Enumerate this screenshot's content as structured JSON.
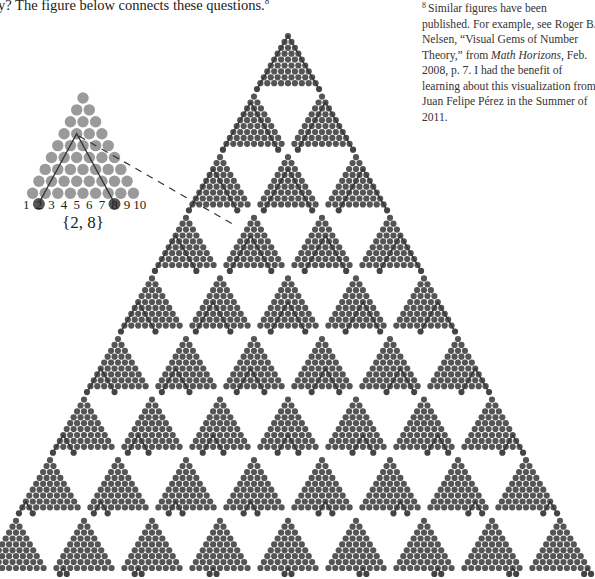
{
  "intro_text": "y? The figure below connects these questions.",
  "intro_footnote_ref": "8",
  "footnote": {
    "mark": "8",
    "text_before_italic": "Similar figures have been published. For example, see Roger B. Nelsen, “Visual Gems of Number Theory,” from ",
    "italic": "Math Horizons",
    "text_after_italic": ", Feb. 2008, p. 7. I had the benefit of learning about this visualization from Juan Felipe Pérez in the Summer of 2011."
  },
  "figure": {
    "colors": {
      "inset_dot": "#9a9a9a",
      "small_dot": "#555555",
      "highlight_dot": "#444444",
      "line": "#333333"
    },
    "inset": {
      "number_labels": [
        "1",
        "2",
        "3",
        "4",
        "5",
        "6",
        "7",
        "8",
        "9",
        "10"
      ],
      "highlighted": [
        2,
        8
      ],
      "set_label": "{2, 8}"
    },
    "grid_rows": 9,
    "pairs": [
      [
        [
          1,
          10
        ]
      ],
      [
        [
          1,
          9
        ],
        [
          2,
          10
        ]
      ],
      [
        [
          1,
          8
        ],
        [
          2,
          9
        ],
        [
          3,
          10
        ]
      ],
      [
        [
          1,
          7
        ],
        [
          2,
          8
        ],
        [
          3,
          9
        ],
        [
          4,
          10
        ]
      ],
      [
        [
          1,
          6
        ],
        [
          2,
          7
        ],
        [
          3,
          8
        ],
        [
          4,
          9
        ],
        [
          5,
          10
        ]
      ],
      [
        [
          1,
          5
        ],
        [
          2,
          6
        ],
        [
          3,
          7
        ],
        [
          4,
          8
        ],
        [
          5,
          9
        ],
        [
          6,
          10
        ]
      ],
      [
        [
          1,
          4
        ],
        [
          2,
          5
        ],
        [
          3,
          6
        ],
        [
          4,
          7
        ],
        [
          5,
          8
        ],
        [
          6,
          9
        ],
        [
          7,
          10
        ]
      ],
      [
        [
          1,
          3
        ],
        [
          2,
          4
        ],
        [
          3,
          5
        ],
        [
          4,
          6
        ],
        [
          5,
          7
        ],
        [
          6,
          8
        ],
        [
          7,
          9
        ],
        [
          8,
          10
        ]
      ],
      [
        [
          1,
          2
        ],
        [
          2,
          3
        ],
        [
          3,
          4
        ],
        [
          4,
          5
        ],
        [
          5,
          6
        ],
        [
          6,
          7
        ],
        [
          7,
          8
        ],
        [
          8,
          9
        ],
        [
          9,
          10
        ]
      ]
    ]
  }
}
